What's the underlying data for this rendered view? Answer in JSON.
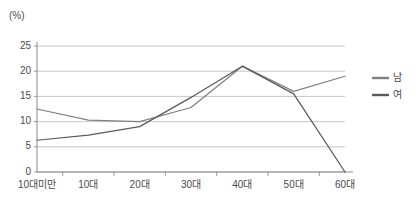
{
  "chart_data": {
    "type": "line",
    "title": "",
    "subtitle": "",
    "unit_label": "(%)",
    "xlabel": "",
    "ylabel": "",
    "categories": [
      "10대미만",
      "10대",
      "20대",
      "30대",
      "40대",
      "50대",
      "60대"
    ],
    "series": [
      {
        "name": "남",
        "color": "#808080",
        "values": [
          12.5,
          10.3,
          10.0,
          12.8,
          21.0,
          16.0,
          19.0
        ]
      },
      {
        "name": "여",
        "color": "#5a5a5a",
        "values": [
          6.3,
          7.3,
          9.0,
          14.8,
          21.0,
          15.5,
          0.0
        ]
      }
    ],
    "ylim": [
      0,
      25
    ],
    "yticks": [
      0,
      5,
      10,
      15,
      20,
      25
    ],
    "ytick_labels": [
      "0",
      "5",
      "10",
      "15",
      "20",
      "25"
    ],
    "grid": true,
    "grid_axis": "y",
    "grid_color": "#b8b8b8",
    "axis_color": "#808080",
    "legend_position": "right",
    "legend": [
      {
        "label": "남",
        "color": "#808080"
      },
      {
        "label": "여",
        "color": "#5a5a5a"
      }
    ]
  }
}
